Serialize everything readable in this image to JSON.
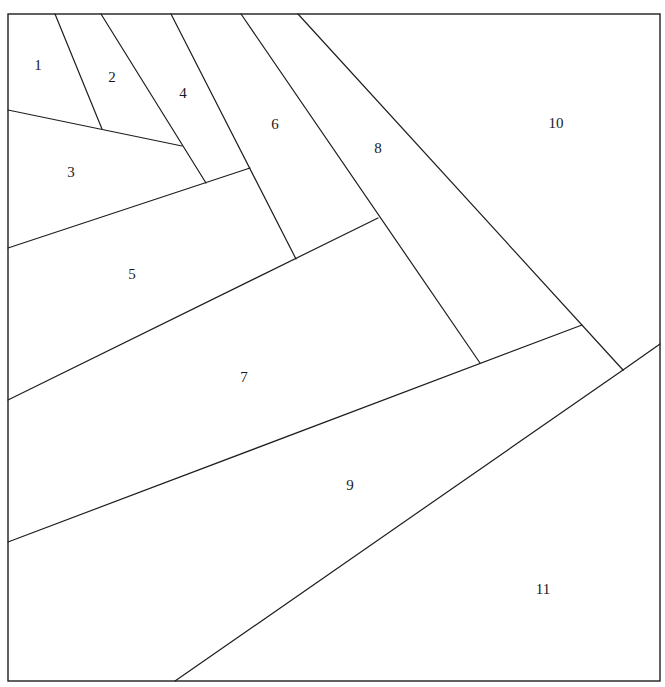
{
  "diagram": {
    "type": "foundation-piecing-pattern",
    "line_color": "#1e1e1e",
    "background": "#ffffff",
    "pieces": [
      {
        "id": 1,
        "label": "1"
      },
      {
        "id": 2,
        "label": "2"
      },
      {
        "id": 3,
        "label": "3"
      },
      {
        "id": 4,
        "label": "4"
      },
      {
        "id": 5,
        "label": "5"
      },
      {
        "id": 6,
        "label": "6"
      },
      {
        "id": 7,
        "label": "7"
      },
      {
        "id": 8,
        "label": "8"
      },
      {
        "id": 9,
        "label": "9"
      },
      {
        "id": 10,
        "label": "10"
      },
      {
        "id": 11,
        "label": "11"
      }
    ],
    "seams": [
      {
        "name": "seam-1-2"
      },
      {
        "name": "seam-1-2-3"
      },
      {
        "name": "seam-2-4"
      },
      {
        "name": "seam-3-4-5"
      },
      {
        "name": "seam-4-6"
      },
      {
        "name": "seam-5-6-7"
      },
      {
        "name": "seam-6-8"
      },
      {
        "name": "seam-7-8-9"
      },
      {
        "name": "seam-8-10"
      },
      {
        "name": "seam-9-10"
      },
      {
        "name": "seam-11"
      }
    ]
  }
}
